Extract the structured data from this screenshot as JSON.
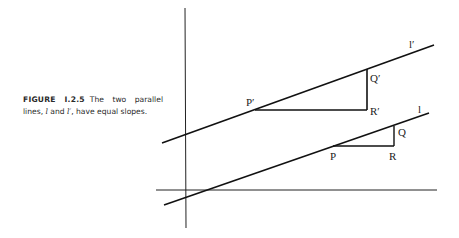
{
  "caption": {
    "figure_label": "FIGURE I.2.5",
    "text_before": "The two parallel lines,",
    "line_1": "l",
    "and": "and",
    "line_2": "l′",
    "text_after": ", have equal slopes."
  },
  "diagram": {
    "labels": {
      "l_prime": "l′",
      "l": "l",
      "P_prime": "P′",
      "Q_prime": "Q′",
      "R_prime": "R′",
      "P": "P",
      "Q": "Q",
      "R": "R"
    }
  }
}
